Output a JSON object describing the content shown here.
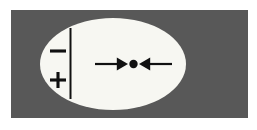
{
  "figure": {
    "title": "Charged ellipse diagram with converging arrows",
    "canvas": {
      "width": 257,
      "height": 130,
      "background": "#ffffff"
    },
    "panel": {
      "name": "gray-panel",
      "fill": "#585858",
      "x": 11,
      "y": 10,
      "width": 237,
      "height": 108
    },
    "ellipse": {
      "name": "white-ellipse",
      "fill": "#f7f7f2",
      "cx": 113,
      "cy": 64,
      "rx": 73,
      "ry": 46
    },
    "divider_line": {
      "name": "vertical-divider",
      "color": "#111111",
      "x": 70,
      "y_top": 28,
      "y_bottom": 99,
      "thickness": 2
    },
    "charge_labels": [
      {
        "id": "minus",
        "symbol": "−",
        "x": 58,
        "y": 51
      },
      {
        "id": "plus",
        "symbol": "+",
        "x": 58,
        "y": 80
      }
    ],
    "arrows": {
      "color": "#111111",
      "axis_y": 64,
      "left": {
        "id": "left-arrow",
        "label": "arrow pointing right",
        "tail_x": 95,
        "head_x": 128,
        "direction": "right"
      },
      "right": {
        "id": "right-arrow",
        "label": "arrow pointing left",
        "tail_x": 172,
        "head_x": 139,
        "direction": "left"
      }
    },
    "center_dot": {
      "name": "center-point",
      "fill": "#111111",
      "cx": 133.5,
      "cy": 64,
      "r": 4.2
    }
  }
}
